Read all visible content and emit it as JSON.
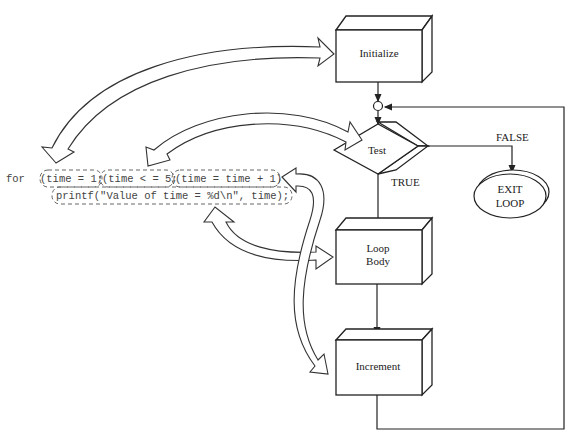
{
  "diagram": {
    "code": {
      "keyword": "for",
      "init": "(time = 1;",
      "test": "(time < = 5;",
      "increment": "(time = time + 1)",
      "body": "printf(\"Value of time = %d\\n\", time);"
    },
    "nodes": {
      "initialize": "Initialize",
      "test": "Test",
      "loop_body_line1": "Loop",
      "loop_body_line2": "Body",
      "increment": "Increment",
      "exit_line1": "EXIT",
      "exit_line2": "LOOP"
    },
    "edge_labels": {
      "false": "FALSE",
      "true": "TRUE"
    }
  }
}
